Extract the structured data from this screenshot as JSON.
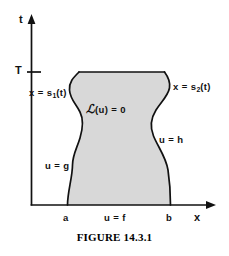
{
  "figure": {
    "caption": "FIGURE 14.3.1",
    "axes": {
      "vertical_label": "t",
      "horizontal_label": "x",
      "tick_label": "T"
    },
    "boundary_labels": {
      "left_curve": "x = s",
      "left_curve_sub": "1",
      "left_curve_tail": "(t)",
      "right_curve": "x = s",
      "right_curve_sub": "2",
      "right_curve_tail": "(t)"
    },
    "region_labels": {
      "interior_operator": "ℒ",
      "interior_equation": "(u) = 0",
      "left_condition": "u = g",
      "right_condition": "u = h",
      "bottom_condition": "u = f"
    },
    "x_ticks": {
      "left": "a",
      "right": "b"
    },
    "colors": {
      "shade_fill": "#d8d8d8",
      "stroke": "#111111",
      "background": "#ffffff",
      "text": "#111111"
    }
  }
}
